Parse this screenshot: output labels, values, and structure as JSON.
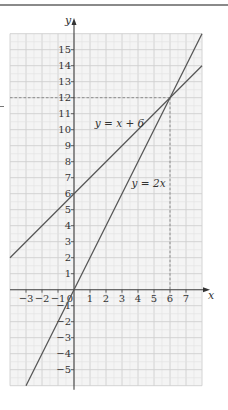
{
  "chart_data": {
    "type": "line",
    "title": "",
    "xlabel": "x",
    "ylabel": "y",
    "xlim": [
      -4,
      8
    ],
    "ylim": [
      -6,
      16
    ],
    "grid": true,
    "x_ticks": [
      -3,
      -2,
      -1,
      0,
      1,
      2,
      3,
      4,
      5,
      6,
      7
    ],
    "x_tick_labels": [
      "−3",
      "−2",
      "−1",
      "0",
      "1",
      "2",
      "3",
      "4",
      "5",
      "6",
      "7"
    ],
    "y_ticks": [
      -5,
      -4,
      -3,
      -2,
      -1,
      1,
      2,
      3,
      4,
      5,
      6,
      7,
      8,
      9,
      10,
      11,
      12,
      13,
      14,
      15
    ],
    "y_tick_labels": [
      "−5",
      "−4",
      "−3",
      "−2",
      "−1",
      "1",
      "2",
      "3",
      "4",
      "5",
      "6",
      "7",
      "8",
      "9",
      "10",
      "11",
      "12",
      "13",
      "14",
      "15"
    ],
    "series": [
      {
        "name": "y = x + 6",
        "label": "y = x + 6",
        "slope": 1,
        "intercept": 6,
        "x": [
          -4,
          8
        ],
        "y": [
          2,
          14
        ],
        "label_anchor": {
          "x": 1.3,
          "y": 10.2
        }
      },
      {
        "name": "y = 2x",
        "label": "y = 2x",
        "slope": 2,
        "intercept": 0,
        "x": [
          -3,
          8
        ],
        "y": [
          -6,
          16
        ],
        "label_anchor": {
          "x": 3.6,
          "y": 6.4
        }
      }
    ],
    "annotations": [
      {
        "type": "intersection",
        "x": 6,
        "y": 12,
        "dashed_guides": true
      }
    ]
  }
}
